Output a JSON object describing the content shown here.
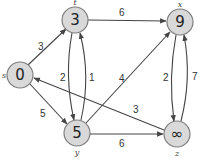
{
  "graph": {
    "directed": true,
    "nodes": [
      {
        "id": "s",
        "name": "s",
        "value": "0",
        "x": 20,
        "y": 75
      },
      {
        "id": "t",
        "name": "t",
        "value": "3",
        "x": 75,
        "y": 20
      },
      {
        "id": "x",
        "name": "x",
        "value": "9",
        "x": 180,
        "y": 22
      },
      {
        "id": "y",
        "name": "y",
        "value": "5",
        "x": 77,
        "y": 133
      },
      {
        "id": "z",
        "name": "z",
        "value": "∞",
        "x": 177,
        "y": 134
      }
    ],
    "edges": [
      {
        "from": "s",
        "to": "t",
        "weight": "3"
      },
      {
        "from": "s",
        "to": "y",
        "weight": "5"
      },
      {
        "from": "t",
        "to": "x",
        "weight": "6"
      },
      {
        "from": "t",
        "to": "y",
        "weight": "2"
      },
      {
        "from": "y",
        "to": "t",
        "weight": "1"
      },
      {
        "from": "y",
        "to": "x",
        "weight": "4"
      },
      {
        "from": "y",
        "to": "z",
        "weight": "6"
      },
      {
        "from": "x",
        "to": "z",
        "weight": "2"
      },
      {
        "from": "z",
        "to": "x",
        "weight": "7"
      },
      {
        "from": "z",
        "to": "s",
        "weight": "3"
      }
    ]
  },
  "colors": {
    "node_fill": "#d9d9d9",
    "node_stroke": "#7f7f7f",
    "edge": "#444444"
  }
}
